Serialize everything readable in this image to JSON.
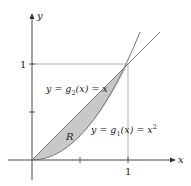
{
  "figure": {
    "type": "region-between-curves",
    "axes": {
      "x_label": "x",
      "y_label": "y",
      "x_tick_label": "1",
      "y_tick_label": "1"
    },
    "curves": [
      {
        "name": "g2",
        "label": "y = g₂(x) = x",
        "label_parts": {
          "prefix": "y = g",
          "sub": "2",
          "suffix": "(x) = x"
        }
      },
      {
        "name": "g1",
        "label": "y = g₁(x) = x²",
        "label_parts": {
          "prefix": "y = g",
          "sub": "1",
          "mid": "(x) = x",
          "sup": "2"
        }
      }
    ],
    "region_label": "R",
    "colors": {
      "region_fill": "#c8c8c8",
      "curve": "#777777",
      "axis": "#333333",
      "guide": "#999999"
    }
  }
}
